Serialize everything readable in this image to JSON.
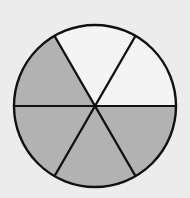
{
  "diagram": {
    "type": "fraction-circle",
    "total_parts": 6,
    "shaded_parts": 4,
    "colors": {
      "background": "#ececec",
      "shaded": "#b2b2b2",
      "unshaded": "#f4f4f4",
      "stroke": "#111111"
    }
  }
}
